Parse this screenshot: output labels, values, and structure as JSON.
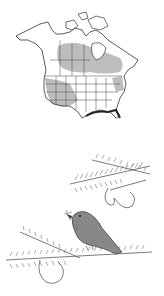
{
  "figures": {
    "range_map": {
      "subject": "North America range map",
      "fill_color": "#bdbdbd",
      "outline_color": "#333333",
      "coast_highlight_color": "#222222"
    },
    "bird_illustration": {
      "subject": "Bird perched on conifer branch with insect in beak",
      "ink_color": "#333333"
    }
  },
  "colors": {
    "background": "#ffffff",
    "range": "#bdbdbd",
    "ink": "#333333"
  }
}
